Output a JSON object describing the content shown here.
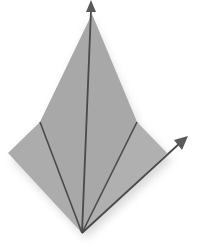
{
  "diagram": {
    "colors": {
      "background": "#ffffff",
      "paper": "#a9a9a9",
      "paper_dark": "#9c9c9c",
      "shadow": "#d8d8d8",
      "line": "#4a4a4a",
      "arrow": "#5a5a5a"
    },
    "points": {
      "bottom": [
        82,
        233
      ],
      "top": [
        92,
        14
      ],
      "left": [
        8,
        153
      ],
      "left_fold": [
        40,
        122
      ],
      "right_fold": [
        137,
        122
      ],
      "right": [
        167,
        153
      ]
    },
    "arrows": [
      {
        "name": "up-arrow",
        "from": [
          82,
          233
        ],
        "to": [
          92,
          0
        ]
      },
      {
        "name": "right-arrow",
        "from": [
          82,
          233
        ],
        "to": [
          188,
          136
        ]
      }
    ]
  }
}
